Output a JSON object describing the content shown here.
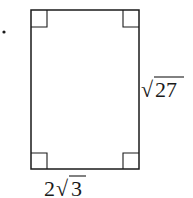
{
  "figure": {
    "bullet": "•",
    "shape": "rectangle",
    "right_angle_markers": 4,
    "side_label_right": {
      "radical": "√",
      "radicand": "27"
    },
    "side_label_bottom": {
      "coefficient": "2",
      "radical": "√",
      "radicand": "3"
    },
    "stroke_color": "#1a1a1a"
  }
}
